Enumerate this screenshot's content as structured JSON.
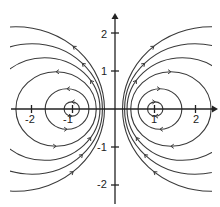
{
  "diagram": {
    "type": "field-lines",
    "colors": {
      "line": "#3a3a3a",
      "axis": "#222222",
      "background": "#ffffff"
    },
    "axes": {
      "x_ticks": [
        {
          "value": -2,
          "label": "-2"
        },
        {
          "value": -1,
          "label": "-1"
        },
        {
          "value": 1,
          "label": "1"
        },
        {
          "value": 2,
          "label": "2"
        }
      ],
      "y_ticks": [
        {
          "value": 2,
          "label": "2"
        },
        {
          "value": 1,
          "label": "1"
        },
        {
          "value": -1,
          "label": "-1"
        },
        {
          "value": -2,
          "label": "-2"
        }
      ],
      "xlim": [
        -2.5,
        2.5
      ],
      "ylim": [
        -2.5,
        2.5
      ]
    },
    "sources": [
      {
        "x": -1,
        "y": 0,
        "circulation": "counterclockwise"
      },
      {
        "x": 1,
        "y": 0,
        "circulation": "clockwise"
      }
    ],
    "ring_inner_crossings": [
      0.83,
      0.6,
      0.42,
      0.33,
      0.27,
      0.22
    ]
  }
}
